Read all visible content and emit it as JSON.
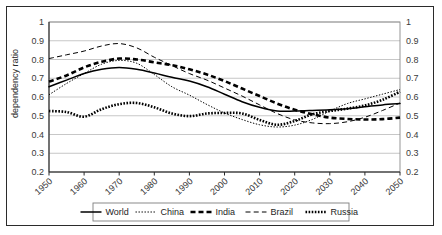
{
  "chart_data": {
    "type": "line",
    "title": "",
    "xlabel": "",
    "ylabel": "dependency ratio",
    "ylabel_right": "",
    "xlim": [
      1950,
      2050
    ],
    "ylim": [
      0.2,
      1.0
    ],
    "y_ticks": [
      "1",
      "0.9",
      "0.8",
      "0.7",
      "0.6",
      "0.5",
      "0.4",
      "0.3",
      "0.2"
    ],
    "y_ticks_right": [
      "1",
      "0.9",
      "0.8",
      "0.7",
      "0.6",
      "0.5",
      "0.4",
      "0.3",
      "0.2"
    ],
    "x_ticks": [
      "1950",
      "1960",
      "1970",
      "1980",
      "1990",
      "2000",
      "2010",
      "2020",
      "2030",
      "2040",
      "2050"
    ],
    "grid": true,
    "legend_position": "bottom",
    "x": [
      1950,
      1955,
      1960,
      1965,
      1970,
      1975,
      1980,
      1985,
      1990,
      1995,
      2000,
      2005,
      2010,
      2015,
      2020,
      2025,
      2030,
      2035,
      2040,
      2045,
      2050
    ],
    "series": [
      {
        "name": "World",
        "style": "solid",
        "color": "#000000",
        "values": [
          0.655,
          0.69,
          0.725,
          0.748,
          0.758,
          0.748,
          0.728,
          0.705,
          0.685,
          0.655,
          0.615,
          0.575,
          0.545,
          0.525,
          0.525,
          0.528,
          0.532,
          0.538,
          0.548,
          0.558,
          0.565
        ]
      },
      {
        "name": "China",
        "style": "fine-dotted",
        "color": "#000000",
        "values": [
          0.612,
          0.672,
          0.725,
          0.775,
          0.795,
          0.78,
          0.72,
          0.655,
          0.61,
          0.56,
          0.515,
          0.48,
          0.452,
          0.44,
          0.45,
          0.48,
          0.525,
          0.565,
          0.59,
          0.615,
          0.64
        ]
      },
      {
        "name": "India",
        "style": "thick-dashed",
        "color": "#000000",
        "values": [
          0.682,
          0.715,
          0.758,
          0.788,
          0.805,
          0.8,
          0.785,
          0.77,
          0.748,
          0.72,
          0.685,
          0.645,
          0.605,
          0.565,
          0.532,
          0.508,
          0.49,
          0.483,
          0.48,
          0.482,
          0.49
        ]
      },
      {
        "name": "Brazil",
        "style": "dashed",
        "color": "#000000",
        "values": [
          0.805,
          0.825,
          0.845,
          0.872,
          0.885,
          0.862,
          0.812,
          0.768,
          0.725,
          0.69,
          0.648,
          0.605,
          0.558,
          0.512,
          0.478,
          0.462,
          0.458,
          0.468,
          0.492,
          0.528,
          0.568
        ]
      },
      {
        "name": "Russia",
        "style": "thick-dotted",
        "color": "#000000",
        "values": [
          0.525,
          0.52,
          0.495,
          0.535,
          0.562,
          0.568,
          0.545,
          0.512,
          0.498,
          0.512,
          0.515,
          0.512,
          0.478,
          0.452,
          0.472,
          0.508,
          0.525,
          0.538,
          0.555,
          0.585,
          0.628
        ]
      }
    ]
  },
  "legend": {
    "items": [
      {
        "label": "World"
      },
      {
        "label": "China"
      },
      {
        "label": "India"
      },
      {
        "label": "Brazil"
      },
      {
        "label": "Russia"
      }
    ]
  }
}
